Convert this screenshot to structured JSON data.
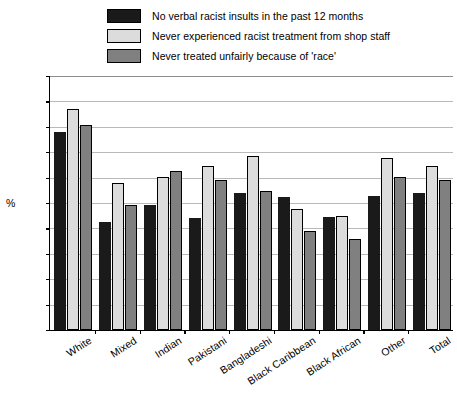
{
  "chart_data": {
    "type": "bar",
    "title": "",
    "xlabel": "",
    "ylabel": "%",
    "ylim": [
      50,
      100
    ],
    "ytick_step": 5,
    "yticks": [
      100,
      95,
      90,
      85,
      80,
      75,
      70,
      65,
      60,
      55,
      50
    ],
    "grid": true,
    "legend_position": "top",
    "categories": [
      "White",
      "Mixed",
      "Indian",
      "Pakistani",
      "Bangladeshi",
      "Black Caribbean",
      "Black African",
      "Other",
      "Total"
    ],
    "series": [
      {
        "name": "No verbal racist insults in the past 12 months",
        "color": "#1a1a1a",
        "values": [
          89.0,
          71.3,
          74.7,
          72.0,
          77.0,
          76.2,
          72.3,
          76.3,
          77.0
        ]
      },
      {
        "name": "Never experienced racist treatment from shop staff",
        "color": "#dcdcdc",
        "values": [
          93.5,
          79.0,
          80.2,
          82.3,
          84.3,
          73.8,
          72.5,
          83.8,
          82.3
        ]
      },
      {
        "name": "Never treated unfairly because of 'race'",
        "color": "#808080",
        "values": [
          90.3,
          74.7,
          81.3,
          79.5,
          77.3,
          69.4,
          68.0,
          80.2,
          79.5
        ]
      }
    ]
  },
  "legend": {
    "items": [
      {
        "label": "No verbal racist insults in the past 12 months",
        "color": "#1a1a1a"
      },
      {
        "label": "Never experienced racist treatment from shop staff",
        "color": "#dcdcdc"
      },
      {
        "label": "Never treated unfairly because of 'race'",
        "color": "#808080"
      }
    ]
  }
}
